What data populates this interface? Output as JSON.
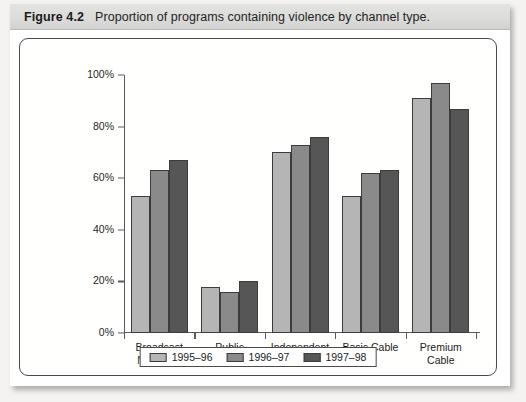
{
  "figure": {
    "number": "Figure 4.2",
    "title": "Proportion of programs containing violence by channel type."
  },
  "chart_data": {
    "type": "bar",
    "title": "Proportion of programs containing violence by channel type.",
    "xlabel": "",
    "ylabel": "",
    "ylim": [
      0,
      100
    ],
    "yticks": [
      "0%",
      "20%",
      "40%",
      "60%",
      "80%",
      "100%"
    ],
    "ytick_values": [
      0,
      20,
      40,
      60,
      80,
      100
    ],
    "grid": false,
    "legend_position": "bottom",
    "categories": [
      "Broadcast Networks",
      "Public Broadcast",
      "Independent Broadcast",
      "Basic Cable",
      "Premium Cable"
    ],
    "category_lines": [
      [
        "Broadcast",
        "Networks"
      ],
      [
        "Public",
        "Broadcast"
      ],
      [
        "Independent",
        "Broadcast"
      ],
      [
        "Basic Cable",
        ""
      ],
      [
        "Premium",
        "Cable"
      ]
    ],
    "series": [
      {
        "name": "1995–96",
        "color": "#b5b5b5",
        "values": [
          53,
          18,
          70,
          53,
          91
        ]
      },
      {
        "name": "1996–97",
        "color": "#8a8a8a",
        "values": [
          63,
          16,
          73,
          62,
          97
        ]
      },
      {
        "name": "1997–98",
        "color": "#565656",
        "values": [
          67,
          20,
          76,
          63,
          87
        ]
      }
    ]
  }
}
